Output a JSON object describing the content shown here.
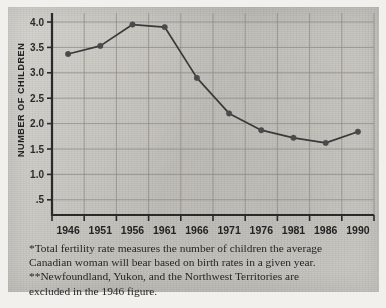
{
  "chart_data": {
    "type": "line",
    "title": "",
    "subtitle": "",
    "xlabel": "",
    "ylabel": "NUMBER OF CHILDREN",
    "categories": [
      "1946",
      "1951",
      "1956",
      "1961",
      "1966",
      "1971",
      "1976",
      "1981",
      "1986",
      "1990"
    ],
    "values": [
      3.37,
      3.53,
      3.95,
      3.9,
      2.9,
      2.2,
      1.87,
      1.72,
      1.62,
      1.84
    ],
    "series": [
      {
        "name": "Total fertility rate",
        "values": [
          3.37,
          3.53,
          3.95,
          3.9,
          2.9,
          2.2,
          1.87,
          1.72,
          1.62,
          1.84
        ]
      }
    ],
    "ylim": [
      0,
      4.25
    ],
    "yticks": [
      4.0,
      3.5,
      3.0,
      2.5,
      2.0,
      1.5,
      1.0,
      0.5
    ],
    "ytick_labels": [
      "4.0",
      "3.5",
      "3.0",
      "2.5",
      "2.0",
      "1.5",
      "1.0",
      ".5"
    ],
    "grid": true,
    "legend": "none",
    "line_color": "#3a3a3a",
    "marker_color": "#4a4a4a",
    "grid_color": "#8d8b86",
    "axis_color": "#2a2a2a",
    "background_color": "#c9c7c1"
  },
  "footnotes": [
    "*Total fertility rate measures the number of children the average",
    "Canadian woman will bear based on birth rates in a given year.",
    "**Newfoundland, Yukon, and the Northwest Territories are",
    "excluded in the 1946 figure."
  ]
}
